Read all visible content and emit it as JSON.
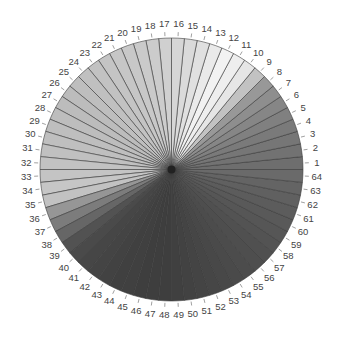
{
  "chart_data": {
    "type": "pie",
    "title": "",
    "xlabel": "",
    "ylabel": "",
    "legend": "none",
    "start_angle_deg": 0,
    "direction": "counterclockwise",
    "categories": [
      "1",
      "2",
      "3",
      "4",
      "5",
      "6",
      "7",
      "8",
      "9",
      "10",
      "11",
      "12",
      "13",
      "14",
      "15",
      "16",
      "17",
      "18",
      "19",
      "20",
      "21",
      "22",
      "23",
      "24",
      "25",
      "26",
      "27",
      "28",
      "29",
      "30",
      "31",
      "32",
      "33",
      "34",
      "35",
      "36",
      "37",
      "38",
      "39",
      "40",
      "41",
      "42",
      "43",
      "44",
      "45",
      "46",
      "47",
      "48",
      "49",
      "50",
      "51",
      "52",
      "53",
      "54",
      "55",
      "56",
      "57",
      "58",
      "59",
      "60",
      "61",
      "62",
      "63",
      "64"
    ],
    "values": [
      1,
      1,
      1,
      1,
      1,
      1,
      1,
      1,
      1,
      1,
      1,
      1,
      1,
      1,
      1,
      1,
      1,
      1,
      1,
      1,
      1,
      1,
      1,
      1,
      1,
      1,
      1,
      1,
      1,
      1,
      1,
      1,
      1,
      1,
      1,
      1,
      1,
      1,
      1,
      1,
      1,
      1,
      1,
      1,
      1,
      1,
      1,
      1,
      1,
      1,
      1,
      1,
      1,
      1,
      1,
      1,
      1,
      1,
      1,
      1,
      1,
      1,
      1,
      1
    ],
    "colors": [
      "#6e6e6e",
      "#727272",
      "#767676",
      "#7a7a7a",
      "#808080",
      "#868686",
      "#8e8e8e",
      "#989898",
      "#c2c2c2",
      "#e6e6e6",
      "#eeeeee",
      "#f2f2f2",
      "#eaeaea",
      "#e0e0e0",
      "#dadada",
      "#d6d6d6",
      "#d0d0d0",
      "#cccccc",
      "#cacaca",
      "#c8c8c8",
      "#c6c6c6",
      "#c4c4c4",
      "#c2c2c2",
      "#c0c0c0",
      "#bebebe",
      "#bcbcbc",
      "#bcbcbc",
      "#bdbdbd",
      "#bebebe",
      "#bfbfbf",
      "#c0c0c0",
      "#c2c2c2",
      "#c4c4c4",
      "#c6c6c6",
      "#c2c2c2",
      "#969696",
      "#7c7c7c",
      "#666666",
      "#525252",
      "#4a4a4a",
      "#464646",
      "#444444",
      "#424242",
      "#404040",
      "#404040",
      "#3e3e3e",
      "#3e3e3e",
      "#3e3e3e",
      "#404040",
      "#424242",
      "#444444",
      "#464646",
      "#484848",
      "#4a4a4a",
      "#4c4c4c",
      "#4e4e4e",
      "#505050",
      "#535353",
      "#565656",
      "#595959",
      "#5c5c5c",
      "#606060",
      "#646464",
      "#6a6a6a"
    ],
    "edge_color": "#3a3a3a",
    "center": [
      171.5,
      169.5
    ],
    "radius": 131.5
  }
}
